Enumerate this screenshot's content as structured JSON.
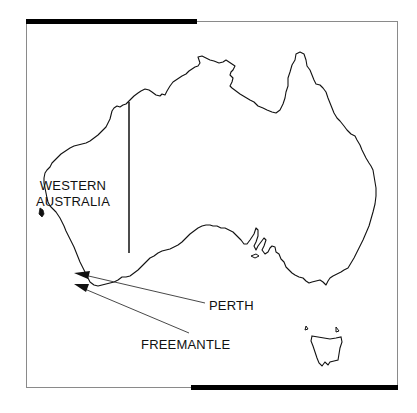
{
  "map": {
    "title": "Australia",
    "region_label_line1": "WESTERN",
    "region_label_line2": "AUSTRALIA",
    "callouts": [
      {
        "label": "PERTH"
      },
      {
        "label": "FREEMANTLE"
      }
    ],
    "colors": {
      "outline": "#111111",
      "frame": "#8a8a8a",
      "bar": "#000000",
      "background": "#ffffff"
    }
  }
}
